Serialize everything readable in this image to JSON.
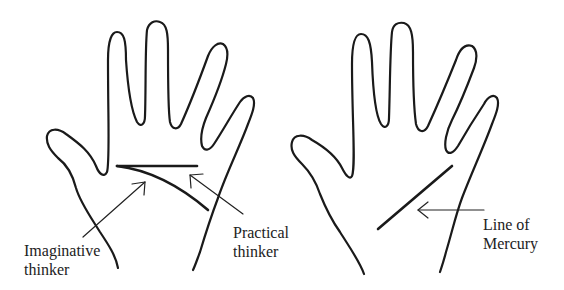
{
  "diagram": {
    "type": "palmistry-illustration",
    "panels": [
      {
        "id": "left-hand",
        "lines": [
          "head line (straight)",
          "head line (curved)"
        ],
        "labels": {
          "imaginative": "Imaginative\nthinker",
          "practical": "Practical\nthinker"
        }
      },
      {
        "id": "right-hand",
        "lines": [
          "line of Mercury"
        ],
        "labels": {
          "mercury": "Line of\nMercury"
        }
      }
    ],
    "colors": {
      "ink": "#1a1a1a",
      "background": "#ffffff"
    }
  }
}
